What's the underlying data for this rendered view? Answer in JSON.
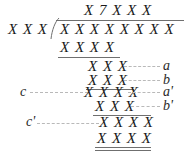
{
  "figure": {
    "placeholder_symbol": "X",
    "colors": {
      "ink": "#1a1a1a",
      "rule": "#6f6f6f",
      "leader": "#b9b9b9",
      "background": "#ffffff"
    }
  },
  "quotient": {
    "text": "X 7 X X X"
  },
  "divisor": {
    "text": "X X X"
  },
  "dividend": {
    "text": "X X X X X X X X"
  },
  "steps": [
    {
      "id": "step1",
      "digits": "X X X X",
      "label": ""
    },
    {
      "id": "step2",
      "digits": "X X X",
      "label": "a"
    },
    {
      "id": "step3",
      "digits": "X X X",
      "label": "b"
    },
    {
      "id": "step4",
      "digits": "X X X X",
      "label": "a'"
    },
    {
      "id": "step5",
      "digits": "X X X",
      "label": "b'"
    },
    {
      "id": "step6",
      "digits": "X X X X",
      "label": ""
    },
    {
      "id": "step7",
      "digits": "X X X X",
      "label": ""
    }
  ],
  "left_labels": [
    {
      "id": "c",
      "text": "c"
    },
    {
      "id": "cp",
      "text": "c'"
    }
  ],
  "right_labels": [
    {
      "id": "a",
      "text": "a"
    },
    {
      "id": "b",
      "text": "b"
    },
    {
      "id": "ap",
      "text": "a'"
    },
    {
      "id": "bp",
      "text": "b'"
    }
  ]
}
